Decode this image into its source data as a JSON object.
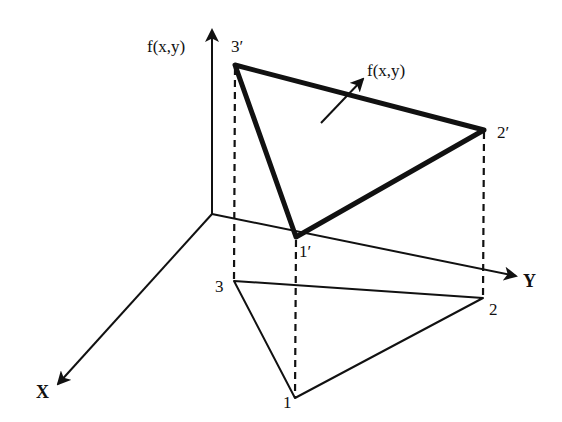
{
  "diagram": {
    "colors": {
      "background": "#ffffff",
      "ink": "#111111"
    },
    "axes": {
      "vertical_label": "f(x,y)",
      "y_label": "Y",
      "x_label": "X"
    },
    "surface_normal_label": "f(x,y)",
    "base_triangle": {
      "vertices": [
        {
          "id": "1",
          "label": "1"
        },
        {
          "id": "2",
          "label": "2"
        },
        {
          "id": "3",
          "label": "3"
        }
      ]
    },
    "lifted_triangle": {
      "vertices": [
        {
          "id": "1p",
          "label": "1′"
        },
        {
          "id": "2p",
          "label": "2′"
        },
        {
          "id": "3p",
          "label": "3′"
        }
      ]
    }
  }
}
